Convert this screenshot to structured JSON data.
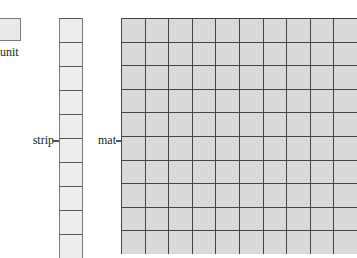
{
  "diagram": {
    "unit": {
      "label": "unit",
      "fill": "#e9e9e9"
    },
    "strip": {
      "label": "strip",
      "cells": 10,
      "fill": "#ececec"
    },
    "mat": {
      "label": "mat",
      "rows": 10,
      "cols": 10,
      "fill": "#d9d9d9"
    }
  }
}
